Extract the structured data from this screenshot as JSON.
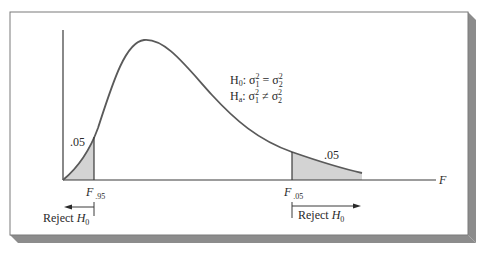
{
  "figure": {
    "frame_color": "#7a7a7a",
    "shadow_color": "#8c8c8c",
    "curve_color": "#5a5a5a",
    "shade_color": "#d3d3d3",
    "axis_color": "#3a3a3a"
  },
  "hypotheses": {
    "h0_label": "H",
    "h0_sub": "0",
    "h0_rest": ": σ",
    "h0_sup1": "2",
    "h0_sub1": "1",
    "h0_eq": " = σ",
    "h0_sup2": "2",
    "h0_sub2": "2",
    "ha_label": "H",
    "ha_sub": "a",
    "ha_rest": ": σ",
    "ha_sup1": "2",
    "ha_sub1": "1",
    "ha_neq": " ≠ σ",
    "ha_sup2": "2",
    "ha_sub2": "2"
  },
  "left_tail": {
    "area_label": ".05",
    "critical_label": "F",
    "critical_sub": ".95",
    "reject_label": "Reject ",
    "reject_h": "H",
    "reject_sub": "0"
  },
  "right_tail": {
    "area_label": ".05",
    "critical_label": "F",
    "critical_sub": ".05",
    "reject_label": "Reject ",
    "reject_h": "H",
    "reject_sub": "0"
  },
  "axis": {
    "x_label": "F"
  }
}
